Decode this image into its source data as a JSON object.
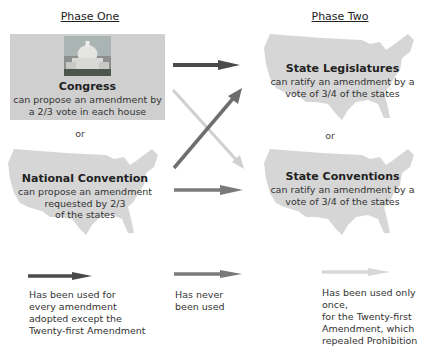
{
  "phase_one": {
    "title": "Phase One",
    "congress": {
      "title": "Congress",
      "text_lines": [
        "can propose an amendment by",
        "a 2/3 vote in each house"
      ]
    },
    "or_label": "or",
    "national_convention": {
      "title": "National Convention",
      "text_lines": [
        "can propose an amendment",
        "requested by 2/3",
        "of the states"
      ]
    }
  },
  "phase_two": {
    "title": "Phase Two",
    "state_legislatures": {
      "title": "State Legislatures",
      "text_lines": [
        "can ratify an amendment by a",
        "vote of 3/4 of the states"
      ]
    },
    "or_label": "or",
    "state_conventions": {
      "title": "State Conventions",
      "text_lines": [
        "can ratify an amendment by a",
        "vote of 3/4 of the states"
      ]
    }
  },
  "arrow_colors": {
    "dark": "#4a4a4a",
    "medium": "#7a7a7a",
    "light": "#d0d0d0"
  },
  "legend": [
    {
      "style": "dark",
      "lines": [
        "Has been used for",
        "every amendment",
        "adopted except the",
        "Twenty-first Amendment"
      ]
    },
    {
      "style": "medium",
      "lines": [
        "Has never",
        "been used"
      ]
    },
    {
      "style": "light",
      "lines": [
        "Has been used only once,",
        "for the Twenty-first",
        "Amendment, which",
        "repealed Prohibition"
      ]
    }
  ]
}
